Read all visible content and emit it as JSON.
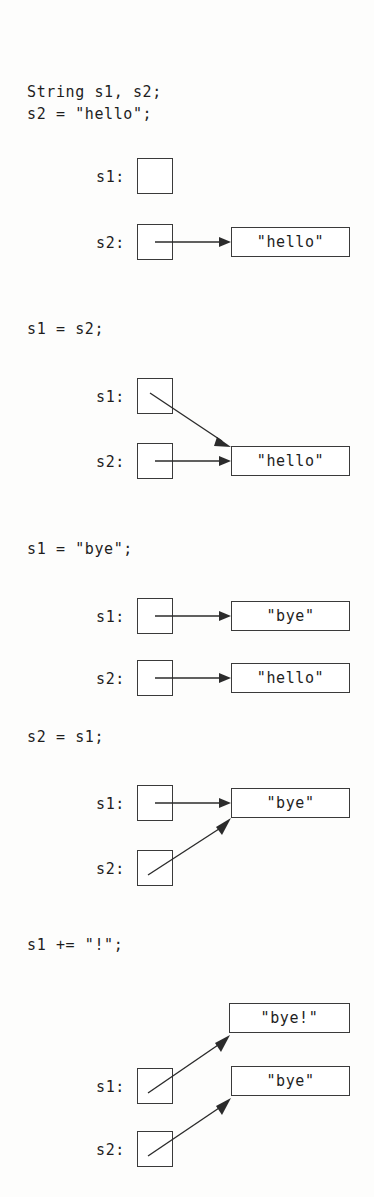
{
  "figure": {
    "title_text_present": false,
    "language": "Java"
  },
  "sections": [
    {
      "id": "decl",
      "code_lines": [
        "String s1, s2;",
        "s2 = \"hello\";"
      ],
      "variables": [
        {
          "label": "s1:",
          "target": null
        },
        {
          "label": "s2:",
          "target": "\"hello\""
        }
      ],
      "value_boxes": [
        "\"hello\""
      ]
    },
    {
      "id": "assign-s1-s2",
      "code_lines": [
        "s1 = s2;"
      ],
      "variables": [
        {
          "label": "s1:",
          "target": "\"hello\""
        },
        {
          "label": "s2:",
          "target": "\"hello\""
        }
      ],
      "value_boxes": [
        "\"hello\""
      ]
    },
    {
      "id": "assign-s1-bye",
      "code_lines": [
        "s1 = \"bye\";"
      ],
      "variables": [
        {
          "label": "s1:",
          "target": "\"bye\""
        },
        {
          "label": "s2:",
          "target": "\"hello\""
        }
      ],
      "value_boxes": [
        "\"bye\"",
        "\"hello\""
      ]
    },
    {
      "id": "assign-s2-s1",
      "code_lines": [
        "s2 = s1;"
      ],
      "variables": [
        {
          "label": "s1:",
          "target": "\"bye\""
        },
        {
          "label": "s2:",
          "target": "\"bye\""
        }
      ],
      "value_boxes": [
        "\"bye\""
      ]
    },
    {
      "id": "append-bang",
      "code_lines": [
        "s1 += \"!\";"
      ],
      "variables": [
        {
          "label": "s1:",
          "target": "\"bye!\""
        },
        {
          "label": "s2:",
          "target": "\"bye\""
        }
      ],
      "value_boxes": [
        "\"bye!\"",
        "\"bye\""
      ]
    }
  ],
  "labels": {
    "s1": "s1:",
    "s2": "s2:"
  },
  "values": {
    "hello": "\"hello\"",
    "bye": "\"bye\"",
    "bye_bang": "\"bye!\""
  },
  "code": {
    "l1": "String s1, s2;",
    "l2": "s2 = \"hello\";",
    "l3": "s1 = s2;",
    "l4": "s1 = \"bye\";",
    "l5": "s2 = s1;",
    "l6": "s1 += \"!\";"
  },
  "colors": {
    "stroke": "#3a3a3a",
    "text": "#1e1e1e",
    "background": "#fdfdfc",
    "box_fill": "#ffffff"
  }
}
